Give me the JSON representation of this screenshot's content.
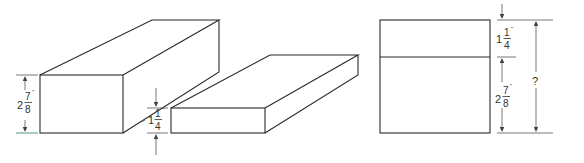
{
  "figure": {
    "type": "technical drawing - stacked blocks dimension problem",
    "colors": {
      "line": "#2a2a2a",
      "dimension": "#555555",
      "text": "#333333",
      "background": "#ffffff"
    }
  },
  "tall_block": {
    "label": "tall block (isometric)",
    "height_dim": {
      "whole": "2",
      "numerator": "7",
      "denominator": "8",
      "unit": "\""
    }
  },
  "flat_block": {
    "label": "flat block (isometric)",
    "height_dim": {
      "whole": "1",
      "numerator": "1",
      "denominator": "4",
      "unit": "\""
    }
  },
  "elevation_view": {
    "label": "stacked front view",
    "top_dim": {
      "whole": "1",
      "numerator": "1",
      "denominator": "4",
      "unit": "\""
    },
    "bottom_dim": {
      "whole": "2",
      "numerator": "7",
      "denominator": "8",
      "unit": "\""
    },
    "total_dim": "?"
  }
}
